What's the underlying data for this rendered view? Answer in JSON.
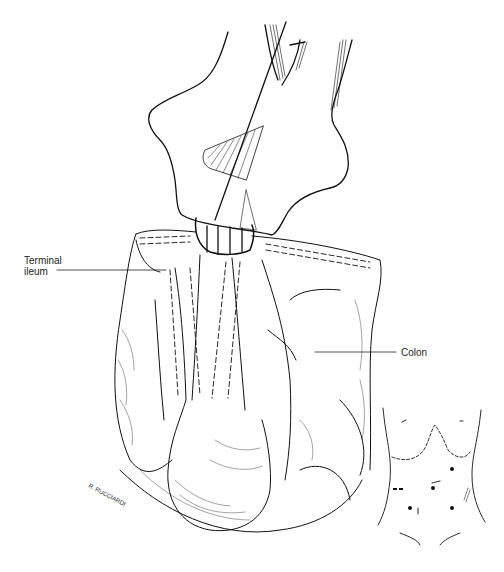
{
  "labels": {
    "terminal_ileum_line1": "Terminal",
    "terminal_ileum_line2": "ileum",
    "colon": "Colon"
  },
  "signature": "R. RUCCIARDI",
  "inset": {
    "description": "Abdominal wall with trocar port sites",
    "port_sites": 5
  }
}
